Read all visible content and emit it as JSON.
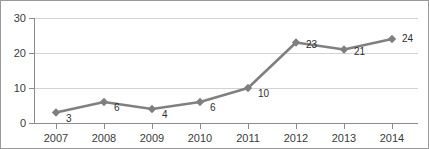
{
  "chart_data": {
    "type": "line",
    "title": "",
    "subtitle": "",
    "xlabel": "",
    "ylabel": "",
    "categories": [
      "2007",
      "2008",
      "2009",
      "2010",
      "2011",
      "2012",
      "2013",
      "2014"
    ],
    "values": [
      3,
      6,
      4,
      6,
      10,
      23,
      21,
      24
    ],
    "point_labels": [
      "3",
      "6",
      "4",
      "6",
      "10",
      "23",
      "21",
      "24"
    ],
    "ylim": [
      0,
      30
    ],
    "yticks": [
      0,
      10,
      20,
      30
    ],
    "ytick_labels": [
      "0",
      "10",
      "20",
      "30"
    ],
    "grid": "horizontal",
    "legend": "none",
    "marker": "diamond",
    "series": [
      {
        "name": "",
        "values": [
          3,
          6,
          4,
          6,
          10,
          23,
          21,
          24
        ]
      }
    ],
    "colors": {
      "line": "#808080",
      "marker": "#7f7f7f",
      "gridline": "#d2d2d2",
      "axis": "#8c8c8c",
      "label_text": "#3b3b3b",
      "point_label_text": "#2e2e2e",
      "background": "#ffffff",
      "border": "#9a9a9a"
    }
  }
}
